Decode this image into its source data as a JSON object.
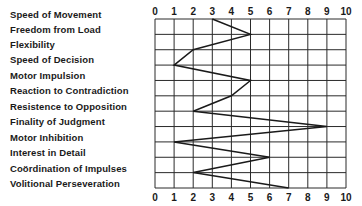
{
  "chart_data": {
    "type": "line",
    "orientation": "horizontal-profile",
    "title": "",
    "xlabel": "",
    "ylabel": "",
    "xlim": [
      0,
      10
    ],
    "x_ticks": [
      "0",
      "1",
      "2",
      "3",
      "4",
      "5",
      "6",
      "7",
      "8",
      "9",
      "10"
    ],
    "grid": true,
    "categories": [
      "Speed of Movement",
      "Freedom from Load",
      "Flexibility",
      "Speed of Decision",
      "Motor Impulsion",
      "Reaction to Contradiction",
      "Resistence to Opposition",
      "Finality of Judgment",
      "Motor Inhibition",
      "Interest in Detail",
      "Coördination of Impulses",
      "Volitional Perseveration"
    ],
    "values": [
      3,
      5,
      2,
      1,
      5,
      4,
      2,
      9,
      1,
      6,
      2,
      7
    ],
    "line_color": "#1a1a1a"
  }
}
